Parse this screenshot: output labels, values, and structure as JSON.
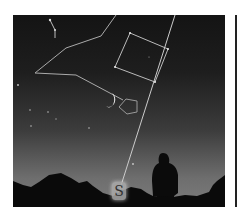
{
  "image": {
    "description": "Night sky with constellation outlines, crescent moon, a standing silhouette on hilly horizon, and a line pointing to south",
    "direction_marker": "S",
    "colors": {
      "sky_top": "#141414",
      "sky_bottom": "#7c7c7c",
      "lines": "#c8c8c8",
      "moon": "#f0f0f0",
      "silhouette": "#0a0a0a"
    }
  }
}
